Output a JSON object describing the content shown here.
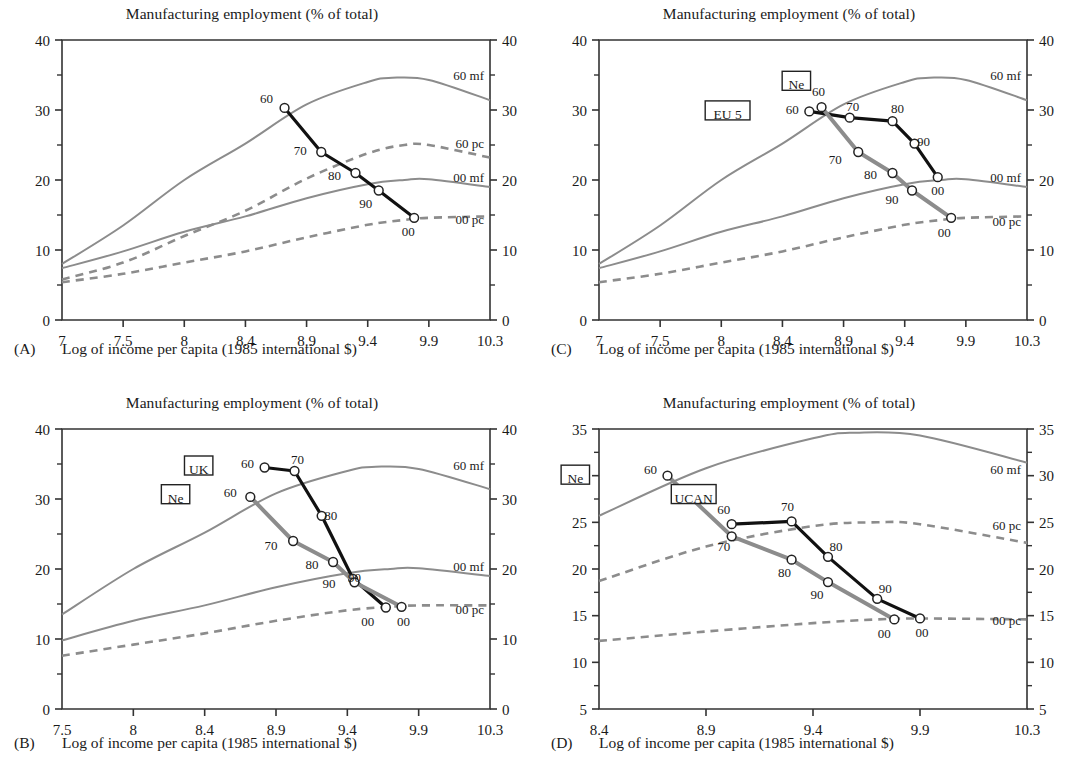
{
  "figure": {
    "common_title": "Manufacturing employment (% of total)",
    "common_xlabel": "Log of income per capita (1985 international $)"
  },
  "panels": [
    {
      "letter": "(A)",
      "title": "Manufacturing employment (% of total)",
      "xlabel": "Log of income per capita (1985 international $)",
      "xticks": [
        "7",
        "7.5",
        "8",
        "8.4",
        "8.9",
        "9.4",
        "9.9",
        "10.3"
      ],
      "yticks": [
        "0",
        "10",
        "20",
        "30",
        "40"
      ],
      "ylim": [
        0,
        40
      ],
      "curve_labels": [
        "60 mf",
        "60 pc",
        "00 mf",
        "00 pc"
      ],
      "boxed_labels": []
    },
    {
      "letter": "(B)",
      "title": "Manufacturing employment (% of total)",
      "xlabel": "Log of income per capita (1985 international $)",
      "xticks": [
        "7.5",
        "8",
        "8.4",
        "8.9",
        "9.4",
        "9.9",
        "10.3"
      ],
      "yticks": [
        "0",
        "10",
        "20",
        "30",
        "40"
      ],
      "ylim": [
        0,
        40
      ],
      "curve_labels": [
        "60 mf",
        "00 mf",
        "00 pc"
      ],
      "boxed_labels": [
        "UK",
        "Ne"
      ]
    },
    {
      "letter": "(C)",
      "title": "Manufacturing employment (% of total)",
      "xlabel": "Log of income per capita (1985 international $)",
      "xticks": [
        "7",
        "7.5",
        "8",
        "8.4",
        "8.9",
        "9.4",
        "9.9",
        "10.3"
      ],
      "yticks": [
        "0",
        "10",
        "20",
        "30",
        "40"
      ],
      "ylim": [
        0,
        40
      ],
      "curve_labels": [
        "60 mf",
        "00 mf",
        "00 pc"
      ],
      "boxed_labels": [
        "Ne",
        "EU 5"
      ]
    },
    {
      "letter": "(D)",
      "title": "Manufacturing employment (% of total)",
      "xlabel": "Log of income per capita (1985 international $)",
      "xticks": [
        "8.4",
        "8.9",
        "9.4",
        "9.9",
        "10.3"
      ],
      "yticks": [
        "5",
        "10",
        "15",
        "20",
        "25",
        "30",
        "35"
      ],
      "ylim": [
        5,
        35
      ],
      "curve_labels": [
        "60 mf",
        "60 pc",
        "00 pc"
      ],
      "boxed_labels": [
        "Ne",
        "UCAN"
      ]
    }
  ],
  "colors": {
    "series_primary": "#111111",
    "series_secondary": "#8c8c8c",
    "reference_curve": "#8c8c8c",
    "axis": "#333333",
    "marker_fill": "#ffffff"
  },
  "chart_data": [
    {
      "panel": "A",
      "type": "line",
      "title": "Manufacturing employment (% of total)",
      "xlabel": "Log of income per capita (1985 international $)",
      "ylabel": "Manufacturing employment (% of total)",
      "xlim": [
        7,
        10.3
      ],
      "ylim": [
        0,
        40
      ],
      "xticks": [
        7,
        7.5,
        8,
        8.4,
        8.9,
        9.4,
        9.9,
        10.3
      ],
      "yticks": [
        0,
        10,
        20,
        30,
        40
      ],
      "grid": false,
      "legend": "inline-right",
      "series": [
        {
          "name": "Ne",
          "style": "solid-black-thick",
          "point_labels": [
            "60",
            "70",
            "80",
            "90",
            "00"
          ],
          "x": [
            8.72,
            9.02,
            9.3,
            9.49,
            9.78
          ],
          "y": [
            30.3,
            24.0,
            21.0,
            18.5,
            14.6
          ]
        }
      ],
      "reference_curves": [
        {
          "name": "60 mf",
          "style": "solid-gray",
          "x": [
            7.0,
            7.5,
            8.0,
            8.4,
            8.9,
            9.4,
            9.6,
            9.9,
            10.3
          ],
          "y": [
            8.0,
            13.5,
            20.0,
            25.2,
            30.8,
            34.0,
            34.6,
            34.3,
            31.4
          ]
        },
        {
          "name": "60 pc",
          "style": "dashed-gray",
          "x": [
            7.0,
            7.5,
            8.0,
            8.4,
            8.9,
            9.4,
            9.7,
            9.9,
            10.3
          ],
          "y": [
            5.8,
            8.2,
            12.0,
            15.6,
            20.2,
            23.8,
            25.0,
            25.0,
            23.2
          ]
        },
        {
          "name": "00 mf",
          "style": "solid-gray",
          "x": [
            7.0,
            7.5,
            8.0,
            8.4,
            8.9,
            9.4,
            9.7,
            9.9,
            10.3
          ],
          "y": [
            7.4,
            9.8,
            12.6,
            14.8,
            17.4,
            19.4,
            20.0,
            20.1,
            19.0
          ]
        },
        {
          "name": "00 pc",
          "style": "dashed-gray",
          "x": [
            7.0,
            7.5,
            8.0,
            8.4,
            8.9,
            9.4,
            9.7,
            9.9,
            10.3
          ],
          "y": [
            5.4,
            6.6,
            8.2,
            9.8,
            11.8,
            13.6,
            14.3,
            14.6,
            14.8
          ]
        }
      ]
    },
    {
      "panel": "B",
      "type": "line",
      "title": "Manufacturing employment (% of total)",
      "xlabel": "Log of income per capita (1985 international $)",
      "ylabel": "Manufacturing employment (% of total)",
      "xlim": [
        7.5,
        10.3
      ],
      "ylim": [
        0,
        40
      ],
      "xticks": [
        7.5,
        8,
        8.4,
        8.9,
        9.4,
        9.9,
        10.3
      ],
      "yticks": [
        0,
        10,
        20,
        30,
        40
      ],
      "grid": false,
      "legend": "boxed-inline",
      "series": [
        {
          "name": "UK",
          "style": "solid-black-thick",
          "point_labels": [
            "60",
            "70",
            "80",
            "90",
            "00"
          ],
          "x": [
            8.82,
            9.03,
            9.22,
            9.44,
            9.67
          ],
          "y": [
            34.5,
            34.0,
            27.6,
            18.6,
            14.5
          ]
        },
        {
          "name": "Ne",
          "style": "solid-gray-thick",
          "point_labels": [
            "60",
            "70",
            "80",
            "90",
            "00"
          ],
          "x": [
            8.72,
            9.02,
            9.3,
            9.45,
            9.78
          ],
          "y": [
            30.3,
            24.0,
            21.0,
            18.1,
            14.6
          ]
        }
      ],
      "reference_curves": [
        {
          "name": "60 mf",
          "style": "solid-gray",
          "x": [
            7.5,
            8.0,
            8.4,
            8.9,
            9.4,
            9.6,
            9.9,
            10.3
          ],
          "y": [
            13.5,
            20.0,
            25.2,
            30.8,
            34.0,
            34.6,
            34.3,
            31.4
          ]
        },
        {
          "name": "00 mf",
          "style": "solid-gray",
          "x": [
            7.5,
            8.0,
            8.4,
            8.9,
            9.4,
            9.7,
            9.9,
            10.3
          ],
          "y": [
            9.8,
            12.6,
            14.8,
            17.4,
            19.4,
            20.0,
            20.1,
            19.0
          ]
        },
        {
          "name": "00 pc",
          "style": "dashed-gray",
          "x": [
            7.5,
            8.0,
            8.4,
            8.9,
            9.4,
            9.7,
            9.9,
            10.3
          ],
          "y": [
            7.6,
            9.2,
            10.8,
            12.6,
            14.1,
            14.6,
            14.8,
            14.8
          ]
        }
      ]
    },
    {
      "panel": "C",
      "type": "line",
      "title": "Manufacturing employment (% of total)",
      "xlabel": "Log of income per capita (1985 international $)",
      "ylabel": "Manufacturing employment (% of total)",
      "xlim": [
        7,
        10.3
      ],
      "ylim": [
        0,
        40
      ],
      "xticks": [
        7,
        7.5,
        8,
        8.4,
        8.9,
        9.4,
        9.9,
        10.3
      ],
      "yticks": [
        0,
        10,
        20,
        30,
        40
      ],
      "grid": false,
      "legend": "boxed-inline",
      "series": [
        {
          "name": "EU 5",
          "style": "solid-black-thick",
          "point_labels": [
            "60",
            "70",
            "80",
            "90",
            "00"
          ],
          "x": [
            8.62,
            8.95,
            9.3,
            9.48,
            9.67
          ],
          "y": [
            29.8,
            28.9,
            28.4,
            25.2,
            20.4
          ]
        },
        {
          "name": "Ne",
          "style": "solid-gray-thick",
          "point_labels": [
            "60",
            "70",
            "80",
            "90",
            "00"
          ],
          "x": [
            8.72,
            9.02,
            9.3,
            9.46,
            9.78
          ],
          "y": [
            30.4,
            24.0,
            21.0,
            18.5,
            14.6
          ]
        }
      ],
      "reference_curves": [
        {
          "name": "60 mf",
          "style": "solid-gray",
          "x": [
            7.0,
            7.5,
            8.0,
            8.4,
            8.9,
            9.4,
            9.6,
            9.9,
            10.3
          ],
          "y": [
            8.0,
            13.5,
            20.0,
            25.2,
            30.8,
            34.0,
            34.6,
            34.3,
            31.4
          ]
        },
        {
          "name": "00 mf",
          "style": "solid-gray",
          "x": [
            7.0,
            7.5,
            8.0,
            8.4,
            8.9,
            9.4,
            9.7,
            9.9,
            10.3
          ],
          "y": [
            7.4,
            9.8,
            12.6,
            14.8,
            17.4,
            19.4,
            20.0,
            20.1,
            19.0
          ]
        },
        {
          "name": "00 pc",
          "style": "dashed-gray",
          "x": [
            7.0,
            7.5,
            8.0,
            8.4,
            8.9,
            9.4,
            9.7,
            9.9,
            10.3
          ],
          "y": [
            5.4,
            6.6,
            8.2,
            9.8,
            11.8,
            13.6,
            14.3,
            14.6,
            14.8
          ]
        }
      ]
    },
    {
      "panel": "D",
      "type": "line",
      "title": "Manufacturing employment (% of total)",
      "xlabel": "Log of income per capita (1985 international $)",
      "ylabel": "Manufacturing employment (% of total)",
      "xlim": [
        8.4,
        10.3
      ],
      "ylim": [
        5,
        35
      ],
      "xticks": [
        8.4,
        8.9,
        9.4,
        9.9,
        10.3
      ],
      "yticks": [
        5,
        10,
        15,
        20,
        25,
        30,
        35
      ],
      "grid": false,
      "legend": "boxed-inline",
      "series": [
        {
          "name": "UCAN",
          "style": "solid-black-thick",
          "point_labels": [
            "60",
            "70",
            "80",
            "90",
            "00"
          ],
          "x": [
            9.02,
            9.3,
            9.47,
            9.7,
            9.9
          ],
          "y": [
            24.8,
            25.1,
            21.3,
            16.8,
            14.7
          ]
        },
        {
          "name": "Ne",
          "style": "solid-gray-thick",
          "point_labels": [
            "60",
            "70",
            "80",
            "90",
            "00"
          ],
          "x": [
            8.72,
            9.02,
            9.3,
            9.47,
            9.78
          ],
          "y": [
            30.0,
            23.5,
            21.0,
            18.6,
            14.6
          ]
        }
      ],
      "reference_curves": [
        {
          "name": "60 mf",
          "style": "solid-gray",
          "x": [
            8.4,
            8.9,
            9.4,
            9.6,
            9.9,
            10.3
          ],
          "y": [
            25.7,
            30.8,
            34.0,
            34.6,
            34.3,
            31.4
          ]
        },
        {
          "name": "60 pc",
          "style": "dashed-gray",
          "x": [
            8.4,
            8.9,
            9.4,
            9.7,
            9.9,
            10.3
          ],
          "y": [
            18.7,
            22.4,
            24.6,
            25.0,
            24.8,
            22.8
          ]
        },
        {
          "name": "00 pc",
          "style": "dashed-gray",
          "x": [
            8.4,
            8.9,
            9.4,
            9.7,
            9.9,
            10.3
          ],
          "y": [
            12.3,
            13.3,
            14.2,
            14.6,
            14.7,
            14.6
          ]
        }
      ]
    }
  ]
}
